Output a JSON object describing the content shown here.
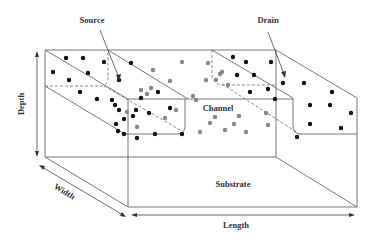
{
  "figure": {
    "type": "MOSFET 3D device structure schematic",
    "labels": {
      "source": "Source",
      "drain": "Drain",
      "channel": "Channel",
      "substrate": "Substrate",
      "depth": "Depth",
      "width": "Width",
      "length": "Length"
    },
    "colors": {
      "line": "#6a6a6a",
      "dopant_dark": "#111111",
      "dopant_gray": "#888888",
      "text": "#333333"
    },
    "dopants": {
      "dark": [
        [
          66,
          58
        ],
        [
          83,
          58
        ],
        [
          104,
          62
        ],
        [
          53,
          72
        ],
        [
          88,
          73
        ],
        [
          69,
          80
        ],
        [
          119,
          80
        ],
        [
          80,
          92
        ],
        [
          97,
          99
        ],
        [
          115,
          105
        ],
        [
          119,
          110
        ],
        [
          136,
          110
        ],
        [
          116,
          124
        ],
        [
          118,
          131
        ],
        [
          124,
          119
        ],
        [
          137,
          138
        ],
        [
          141,
          98
        ],
        [
          124,
          134
        ],
        [
          158,
          92
        ],
        [
          155,
          134
        ],
        [
          149,
          113
        ],
        [
          170,
          108
        ],
        [
          182,
          134
        ],
        [
          131,
          63
        ],
        [
          133,
          116
        ],
        [
          112,
          100
        ],
        [
          233,
          57
        ],
        [
          246,
          62
        ],
        [
          271,
          62
        ],
        [
          237,
          75
        ],
        [
          254,
          75
        ],
        [
          283,
          83
        ],
        [
          268,
          89
        ],
        [
          250,
          92
        ],
        [
          275,
          99
        ],
        [
          304,
          83
        ],
        [
          332,
          92
        ],
        [
          310,
          105
        ],
        [
          330,
          105
        ],
        [
          351,
          113
        ],
        [
          310,
          124
        ],
        [
          341,
          128
        ],
        [
          297,
          137
        ]
      ],
      "gray": [
        [
          182,
          62
        ],
        [
          208,
          63
        ],
        [
          222,
          72
        ],
        [
          153,
          70
        ],
        [
          170,
          81
        ],
        [
          151,
          88
        ],
        [
          147,
          94
        ],
        [
          127,
          112
        ],
        [
          193,
          96
        ],
        [
          141,
          90
        ],
        [
          176,
          110
        ],
        [
          196,
          100
        ],
        [
          165,
          118
        ],
        [
          216,
          80
        ],
        [
          220,
          74
        ],
        [
          206,
          80
        ],
        [
          228,
          85
        ],
        [
          200,
          132
        ],
        [
          215,
          117
        ],
        [
          234,
          124
        ],
        [
          239,
          116
        ],
        [
          210,
          123
        ],
        [
          225,
          130
        ],
        [
          246,
          132
        ],
        [
          266,
          113
        ],
        [
          268,
          125
        ],
        [
          137,
          127
        ]
      ]
    }
  }
}
